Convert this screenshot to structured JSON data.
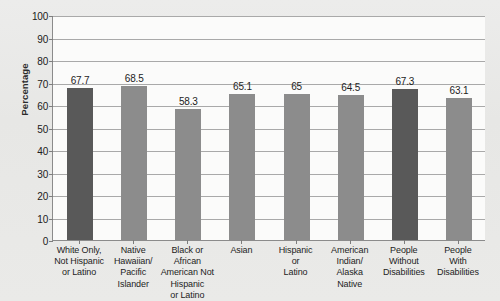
{
  "chart_data": {
    "type": "bar",
    "title": "",
    "xlabel": "",
    "ylabel": "Percentage",
    "ylim": [
      0,
      100
    ],
    "ytick_step": 10,
    "yticks": [
      100,
      90,
      80,
      70,
      60,
      50,
      40,
      30,
      20,
      10,
      0
    ],
    "grid": true,
    "legend": "none",
    "categories": [
      "White Only,\nNot Hispanic\nor Latino",
      "Native\nHawaiian/\nPacific\nIslander",
      "Black or African\nAmerican Not\nHispanic\nor Latino",
      "Asian",
      "Hispanic\nor\nLatino",
      "American\nIndian/\nAlaska\nNative",
      "People\nWithout\nDisabilities",
      "People\nWith\nDisabilities"
    ],
    "values": [
      67.7,
      68.5,
      58.3,
      65.1,
      65,
      64.5,
      67.3,
      63.1
    ],
    "value_labels": [
      "67.7",
      "68.5",
      "58.3",
      "65.1",
      "65",
      "64.5",
      "67.3",
      "63.1"
    ],
    "bar_colors": [
      "#595959",
      "#8c8c8c",
      "#8c8c8c",
      "#8c8c8c",
      "#8c8c8c",
      "#8c8c8c",
      "#595959",
      "#8c8c8c"
    ]
  },
  "colors": {
    "page_background": "#e9e9e7",
    "plot_background": "#fbfbfa",
    "axis_line": "#8b8b8b",
    "gridline": "#a9a9a9",
    "text": "#1d1d1d",
    "bar_dark": "#595959",
    "bar_medium": "#8c8c8c"
  }
}
